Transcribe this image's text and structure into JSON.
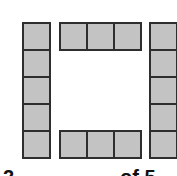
{
  "figure": {
    "tile_fill_color": "#c3c3c3",
    "tile_border_color": "#2e2e2e",
    "background_color": "#ffffff",
    "groups": [
      {
        "name": "left-column",
        "orientation": "vertical",
        "tiles": 5
      },
      {
        "name": "top-row",
        "orientation": "horizontal",
        "tiles": 3
      },
      {
        "name": "bottom-row",
        "orientation": "horizontal",
        "tiles": 3
      },
      {
        "name": "right-column",
        "orientation": "vertical",
        "tiles": 5
      }
    ]
  },
  "caption": {
    "left_fragment": "2",
    "right_fragment": "of 5"
  }
}
